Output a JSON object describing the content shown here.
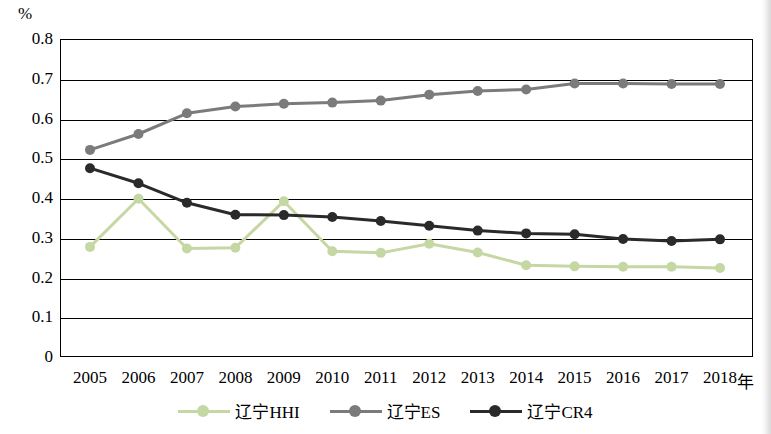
{
  "chart_data": {
    "type": "line",
    "title": "",
    "xlabel": "年",
    "ylabel": "%",
    "ylim": [
      0,
      0.8
    ],
    "yticks": [
      0,
      0.1,
      0.2,
      0.3,
      0.4,
      0.5,
      0.6,
      0.7,
      0.8
    ],
    "ytick_labels": [
      "0",
      "0.1",
      "0.2",
      "0.3",
      "0.4",
      "0.5",
      "0.6",
      "0.7",
      "0.8"
    ],
    "categories": [
      "2005",
      "2006",
      "2007",
      "2008",
      "2009",
      "2010",
      "2011",
      "2012",
      "2013",
      "2014",
      "2015",
      "2016",
      "2017",
      "2018"
    ],
    "grid": true,
    "legend_position": "bottom",
    "series": [
      {
        "name": "辽宁HHI",
        "color": "#c5d8a4",
        "values": [
          0.277,
          0.398,
          0.273,
          0.275,
          0.392,
          0.266,
          0.262,
          0.285,
          0.263,
          0.231,
          0.228,
          0.227,
          0.227,
          0.224
        ]
      },
      {
        "name": "辽宁ES",
        "color": "#7b7b7b",
        "values": [
          0.521,
          0.561,
          0.613,
          0.63,
          0.637,
          0.64,
          0.645,
          0.66,
          0.669,
          0.673,
          0.688,
          0.688,
          0.687,
          0.687
        ]
      },
      {
        "name": "辽宁CR4",
        "color": "#2a2a2a",
        "values": [
          0.475,
          0.437,
          0.388,
          0.358,
          0.357,
          0.352,
          0.342,
          0.33,
          0.318,
          0.311,
          0.309,
          0.297,
          0.292,
          0.296
        ]
      }
    ]
  },
  "axis": {
    "unit_top": "%",
    "unit_right": "年"
  }
}
